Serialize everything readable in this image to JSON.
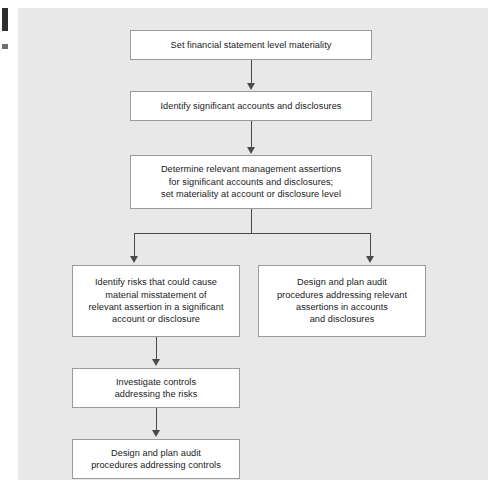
{
  "figure": {
    "type": "flowchart",
    "orientation": "top-to-bottom",
    "canvas_color": "#e8e8e8",
    "box_fill": "#ffffff",
    "box_border_color": "#9a9a9a",
    "connector_color": "#4a4a4a",
    "text_color": "#1a1a1a",
    "nodes": [
      {
        "id": "n1",
        "name": "set-materiality",
        "text": "Set financial statement level materiality"
      },
      {
        "id": "n2",
        "name": "identify-accounts",
        "text": "Identify significant accounts and disclosures"
      },
      {
        "id": "n3",
        "name": "determine-assertions",
        "text": "Determine relevant management assertions\nfor significant accounts and disclosures;\nset materiality at account or disclosure level"
      },
      {
        "id": "n4",
        "name": "identify-risks",
        "text": "Identify risks that could cause\nmaterial misstatement of\nrelevant assertion in a significant\naccount or disclosure"
      },
      {
        "id": "n5",
        "name": "design-substantive-procedures",
        "text": "Design and plan audit\nprocedures addressing relevant\nassertions in accounts\nand disclosures"
      },
      {
        "id": "n6",
        "name": "investigate-controls",
        "text": "Investigate controls\naddressing the risks"
      },
      {
        "id": "n7",
        "name": "design-control-procedures",
        "text": "Design and plan audit\nprocedures addressing controls"
      }
    ],
    "edges": [
      {
        "from": "n1",
        "to": "n2",
        "style": "arrow-down"
      },
      {
        "from": "n2",
        "to": "n3",
        "style": "arrow-down"
      },
      {
        "from": "n3",
        "to": "n4",
        "style": "split-branch-arrow-down"
      },
      {
        "from": "n3",
        "to": "n5",
        "style": "split-branch-arrow-down"
      },
      {
        "from": "n4",
        "to": "n6",
        "style": "arrow-down"
      },
      {
        "from": "n6",
        "to": "n7",
        "style": "arrow-down"
      }
    ]
  }
}
